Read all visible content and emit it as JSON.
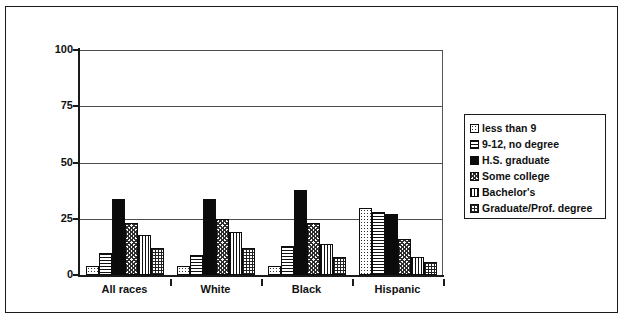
{
  "chart_data": {
    "type": "bar",
    "title": "",
    "xlabel": "",
    "ylabel": "",
    "ylim": [
      0,
      100
    ],
    "yticks": [
      0,
      25,
      50,
      75,
      100
    ],
    "grid": true,
    "legend_position": "right",
    "categories": [
      "All races",
      "White",
      "Black",
      "Hispanic"
    ],
    "series": [
      {
        "name": "less than 9",
        "pattern": "dots",
        "values": [
          4,
          4,
          4,
          30
        ]
      },
      {
        "name": "9-12, no degree",
        "pattern": "horz",
        "values": [
          10,
          9,
          13,
          28
        ]
      },
      {
        "name": "H.S. graduate",
        "pattern": "solid",
        "values": [
          34,
          34,
          38,
          27
        ]
      },
      {
        "name": "Some college",
        "pattern": "check",
        "values": [
          23,
          25,
          23,
          16
        ]
      },
      {
        "name": "Bachelor's",
        "pattern": "vert",
        "values": [
          18,
          19,
          14,
          8
        ]
      },
      {
        "name": "Graduate/Prof. degree",
        "pattern": "grid",
        "values": [
          12,
          12,
          8,
          6
        ]
      }
    ]
  },
  "legend": {
    "items": [
      "less than 9",
      "9-12, no degree",
      "H.S. graduate",
      "Some college",
      "Bachelor's",
      "Graduate/Prof. degree"
    ]
  },
  "colors": {
    "axis": "#1a1a1a",
    "grid": "#4d4d4d",
    "bar_outline": "#0d0d0d",
    "background": "#ffffff",
    "border": "#1a1a1a"
  }
}
